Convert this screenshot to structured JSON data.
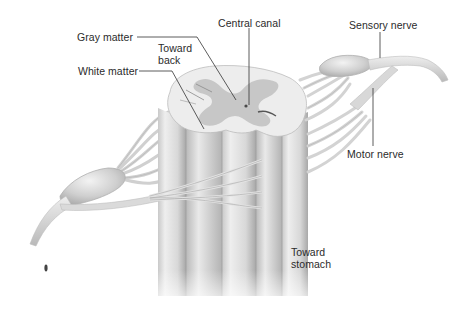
{
  "figure": {
    "colors": {
      "background": "#ffffff",
      "white_matter": "#ececec",
      "gray_matter": "#bdbdbd",
      "column_light": "#e2e2e2",
      "column_shade": "#a9a9a9",
      "nerve": "#d6d6d6",
      "leader_line": "#333333",
      "label_text": "#2b2b2b"
    }
  },
  "labels": {
    "gray_matter": "Gray matter",
    "white_matter": "White matter",
    "toward_back_line1": "Toward",
    "toward_back_line2": "back",
    "central_canal": "Central canal",
    "sensory_nerve": "Sensory nerve",
    "motor_nerve": "Motor nerve",
    "toward_stomach_line1": "Toward",
    "toward_stomach_line2": "stomach"
  }
}
